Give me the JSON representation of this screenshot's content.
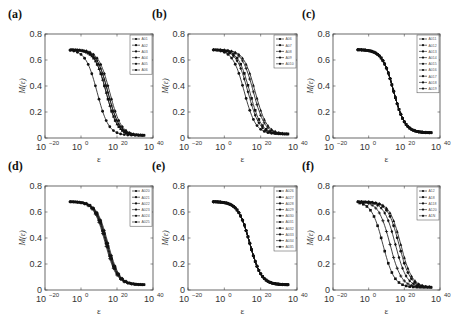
{
  "chart_data": [
    {
      "panel": "(a)",
      "type": "line",
      "xlabel": "ε",
      "ylabel": "M(ε)",
      "xscale": "log",
      "xlim_exp": [
        -20,
        40
      ],
      "xticks": [
        "10^-20",
        "10^0",
        "10^20",
        "10^40"
      ],
      "ylim": [
        0,
        0.8
      ],
      "yticks": [
        "0",
        "0.2",
        "0.4",
        "0.6",
        "0.8"
      ],
      "legend": [
        "A01",
        "A02",
        "A03",
        "A04",
        "A05",
        "A06"
      ],
      "legend_position": "upper right",
      "series": [
        {
          "name": "A01",
          "shift": -5
        },
        {
          "name": "A02",
          "shift": 0
        },
        {
          "name": "A03",
          "shift": 1
        },
        {
          "name": "A04",
          "shift": 2
        },
        {
          "name": "A05",
          "shift": 0
        },
        {
          "name": "A06",
          "shift": 1
        }
      ],
      "plateau": 0.68,
      "x_start_exp": -6,
      "x_end_exp": 35,
      "end_value": 0.02
    },
    {
      "panel": "(b)",
      "type": "line",
      "xlabel": "ε",
      "ylabel": "M(ε)",
      "xscale": "log",
      "xlim_exp": [
        -20,
        40
      ],
      "xticks": [
        "10^-20",
        "10^0",
        "10^20",
        "10^40"
      ],
      "ylim": [
        0,
        0.8
      ],
      "yticks": [
        "0",
        "0.2",
        "0.4",
        "0.6",
        "0.8"
      ],
      "legend": [
        "A06",
        "A07",
        "A08",
        "A09",
        "A010"
      ],
      "legend_position": "upper right",
      "series": [
        {
          "name": "A06",
          "shift": -3
        },
        {
          "name": "A07",
          "shift": 0
        },
        {
          "name": "A08",
          "shift": 2
        },
        {
          "name": "A09",
          "shift": -1
        },
        {
          "name": "A010",
          "shift": 3
        }
      ],
      "plateau": 0.68,
      "x_start_exp": -6,
      "x_end_exp": 35,
      "end_value": 0.03
    },
    {
      "panel": "(c)",
      "type": "line",
      "xlabel": "ε",
      "ylabel": "M(ε)",
      "xscale": "log",
      "xlim_exp": [
        -20,
        40
      ],
      "xticks": [
        "10^-20",
        "10^0",
        "10^20",
        "10^40"
      ],
      "ylim": [
        0,
        0.8
      ],
      "yticks": [
        "0",
        "0.2",
        "0.4",
        "0.6",
        "0.8"
      ],
      "legend": [
        "A011",
        "A012",
        "A013",
        "A014",
        "A015",
        "A016",
        "A017",
        "A018",
        "A019"
      ],
      "legend_position": "upper right",
      "series": [
        {
          "name": "A011",
          "shift": 0
        },
        {
          "name": "A012",
          "shift": 0
        },
        {
          "name": "A013",
          "shift": 0
        },
        {
          "name": "A014",
          "shift": 0
        },
        {
          "name": "A015",
          "shift": 0
        },
        {
          "name": "A016",
          "shift": 0
        },
        {
          "name": "A017",
          "shift": 0
        },
        {
          "name": "A018",
          "shift": 0
        },
        {
          "name": "A019",
          "shift": 0
        }
      ],
      "plateau": 0.68,
      "x_start_exp": -6,
      "x_end_exp": 35,
      "end_value": 0.04
    },
    {
      "panel": "(d)",
      "type": "line",
      "xlabel": "ε",
      "ylabel": "M(ε)",
      "xscale": "log",
      "xlim_exp": [
        -20,
        40
      ],
      "xticks": [
        "10^-20",
        "10^0",
        "10^20",
        "10^40"
      ],
      "ylim": [
        0,
        0.8
      ],
      "yticks": [
        "0",
        "0.2",
        "0.4",
        "0.6",
        "0.8"
      ],
      "legend": [
        "A020",
        "A021",
        "A022",
        "A023",
        "A024",
        "A025"
      ],
      "legend_position": "upper right",
      "series": [
        {
          "name": "A020",
          "shift": 0
        },
        {
          "name": "A021",
          "shift": 0.5
        },
        {
          "name": "A022",
          "shift": -0.5
        },
        {
          "name": "A023",
          "shift": 1
        },
        {
          "name": "A024",
          "shift": 0
        },
        {
          "name": "A025",
          "shift": 0.5
        }
      ],
      "plateau": 0.68,
      "x_start_exp": -6,
      "x_end_exp": 35,
      "end_value": 0.04
    },
    {
      "panel": "(e)",
      "type": "line",
      "xlabel": "ε",
      "ylabel": "M(ε)",
      "xscale": "log",
      "xlim_exp": [
        -20,
        40
      ],
      "xticks": [
        "10^-20",
        "10^0",
        "10^20",
        "10^40"
      ],
      "ylim": [
        0,
        0.8
      ],
      "yticks": [
        "0",
        "0.2",
        "0.4",
        "0.6",
        "0.8"
      ],
      "legend": [
        "A026",
        "A027",
        "A028",
        "A029",
        "A030",
        "A031",
        "A032",
        "A033",
        "A034",
        "A035"
      ],
      "legend_position": "upper right",
      "series": [
        {
          "name": "A026",
          "shift": 0
        },
        {
          "name": "A027",
          "shift": 0
        },
        {
          "name": "A028",
          "shift": 0
        },
        {
          "name": "A029",
          "shift": 0
        },
        {
          "name": "A030",
          "shift": 0
        },
        {
          "name": "A031",
          "shift": 0
        },
        {
          "name": "A032",
          "shift": 0
        },
        {
          "name": "A033",
          "shift": 0
        },
        {
          "name": "A034",
          "shift": 0
        },
        {
          "name": "A035",
          "shift": 0
        }
      ],
      "plateau": 0.68,
      "x_start_exp": -6,
      "x_end_exp": 35,
      "end_value": 0.04
    },
    {
      "panel": "(f)",
      "type": "line",
      "xlabel": "ε",
      "ylabel": "M(ε)",
      "xscale": "log",
      "xlim_exp": [
        -20,
        40
      ],
      "xticks": [
        "10^-20",
        "10^0",
        "10^20",
        "10^40"
      ],
      "ylim": [
        0,
        0.8
      ],
      "yticks": [
        "0",
        "0.2",
        "0.4",
        "0.6",
        "0.8"
      ],
      "legend": [
        "A12",
        "A18",
        "A118",
        "A120",
        "A1N"
      ],
      "legend_position": "upper right",
      "series": [
        {
          "name": "A12",
          "shift": 3
        },
        {
          "name": "A18",
          "shift": -6
        },
        {
          "name": "A118",
          "shift": -2
        },
        {
          "name": "A120",
          "shift": 1
        },
        {
          "name": "A1N",
          "shift": 4
        }
      ],
      "plateau": 0.68,
      "x_start_exp": -6,
      "x_end_exp": 35,
      "end_value": 0.02
    }
  ],
  "figure": {
    "panel_labels": [
      "(a)",
      "(b)",
      "(c)",
      "(d)",
      "(e)",
      "(f)"
    ],
    "xlabel": "ε",
    "ylabel": "M(ε)",
    "xtick_base": "10",
    "xtick_exps": [
      "−20",
      "0",
      "20",
      "40"
    ],
    "yticks": [
      "0",
      "0.2",
      "0.4",
      "0.6",
      "0.8"
    ]
  }
}
